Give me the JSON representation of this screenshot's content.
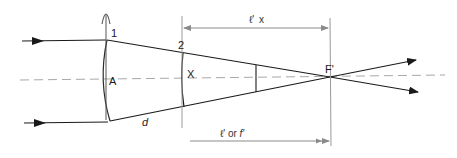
{
  "diagram": {
    "title": "",
    "labels": {
      "surface_1": "1",
      "surface_2": "2",
      "vertex_a": "A",
      "point_x": "X",
      "focal_point": "F'",
      "ray_distance": "d",
      "dim_top_prefix": "ℓ'",
      "dim_top_suffix": "x",
      "dim_bottom_prefix": "ℓ' or ",
      "dim_bottom_italic": "f'"
    },
    "colors": {
      "ray": "#1a1a1a",
      "axis": "#9a9a9a",
      "dimension": "#8a8a8a",
      "surface": "#2a2a2a"
    }
  }
}
